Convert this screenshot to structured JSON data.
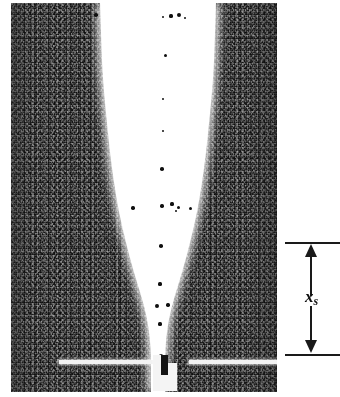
{
  "figure": {
    "kind": "grayscale-photograph",
    "photo": {
      "left": 11,
      "top": 3,
      "width": 266,
      "height": 389,
      "background_color": "#111111",
      "plume_color": "#ffffff"
    },
    "substrate": {
      "name": "substrate-bright-line",
      "color": "#f2f2f2",
      "y": 357
    },
    "nozzle": {
      "name": "nozzle-structure",
      "color": "#f4f4f4"
    },
    "plume_outline": {
      "note": "half-width of the white plume measured from the photo centreline at each height",
      "centerline_x": 147,
      "samples": [
        {
          "y": 0,
          "half_width": 58
        },
        {
          "y": 30,
          "half_width": 57
        },
        {
          "y": 60,
          "half_width": 56
        },
        {
          "y": 90,
          "half_width": 54
        },
        {
          "y": 120,
          "half_width": 51
        },
        {
          "y": 150,
          "half_width": 48
        },
        {
          "y": 180,
          "half_width": 44
        },
        {
          "y": 210,
          "half_width": 39
        },
        {
          "y": 240,
          "half_width": 32
        },
        {
          "y": 270,
          "half_width": 24
        },
        {
          "y": 295,
          "half_width": 16
        },
        {
          "y": 315,
          "half_width": 11
        },
        {
          "y": 335,
          "half_width": 8
        },
        {
          "y": 355,
          "half_width": 7
        },
        {
          "y": 375,
          "half_width": 7
        },
        {
          "y": 389,
          "half_width": 7
        }
      ]
    },
    "specks": [
      {
        "x": 160,
        "y": 13,
        "r": 1.6
      },
      {
        "x": 168,
        "y": 12,
        "r": 2.2
      },
      {
        "x": 152,
        "y": 14,
        "r": 1.2
      },
      {
        "x": 174,
        "y": 15,
        "r": 1.1
      },
      {
        "x": 85,
        "y": 12,
        "r": 1.8
      },
      {
        "x": 154,
        "y": 52,
        "r": 1.5
      },
      {
        "x": 152,
        "y": 96,
        "r": 1.1
      },
      {
        "x": 152,
        "y": 128,
        "r": 1.4
      },
      {
        "x": 151,
        "y": 166,
        "r": 1.8
      },
      {
        "x": 122,
        "y": 205,
        "r": 1.7
      },
      {
        "x": 151,
        "y": 203,
        "r": 1.7
      },
      {
        "x": 161,
        "y": 201,
        "r": 1.6
      },
      {
        "x": 167,
        "y": 204,
        "r": 1.5
      },
      {
        "x": 165,
        "y": 208,
        "r": 1.3
      },
      {
        "x": 179,
        "y": 205,
        "r": 1.5
      },
      {
        "x": 150,
        "y": 243,
        "r": 1.8
      },
      {
        "x": 149,
        "y": 281,
        "r": 1.6
      },
      {
        "x": 146,
        "y": 303,
        "r": 1.9
      },
      {
        "x": 157,
        "y": 302,
        "r": 1.7
      },
      {
        "x": 149,
        "y": 321,
        "r": 1.6
      },
      {
        "x": 150,
        "y": 353,
        "r": 1.7
      }
    ]
  },
  "annotation": {
    "name": "dimension-xs",
    "label": "x",
    "subscript": "s",
    "arrow_color": "#1a1a1a",
    "top_tick_y": 242,
    "bottom_tick_y": 354,
    "double_headed": true
  }
}
